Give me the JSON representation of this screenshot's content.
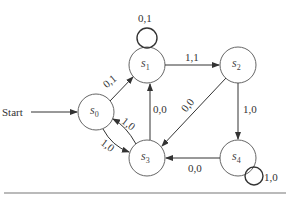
{
  "diagram": {
    "type": "finite-state machine",
    "start_label": "Start",
    "states": [
      {
        "id": "s0",
        "name": "s",
        "sub": "0",
        "x": 96,
        "y": 112
      },
      {
        "id": "s1",
        "name": "s",
        "sub": "1",
        "x": 147,
        "y": 65
      },
      {
        "id": "s2",
        "name": "s",
        "sub": "2",
        "x": 238,
        "y": 65
      },
      {
        "id": "s3",
        "name": "s",
        "sub": "3",
        "x": 147,
        "y": 158
      },
      {
        "id": "s4",
        "name": "s",
        "sub": "4",
        "x": 238,
        "y": 158
      }
    ],
    "transitions": [
      {
        "from": "s0",
        "to": "s1",
        "label": "0,1"
      },
      {
        "from": "s1",
        "to": "s1",
        "label": "0,1"
      },
      {
        "from": "s1",
        "to": "s2",
        "label": "1,1"
      },
      {
        "from": "s2",
        "to": "s3",
        "label": "0,0"
      },
      {
        "from": "s2",
        "to": "s4",
        "label": "1,0"
      },
      {
        "from": "s3",
        "to": "s1",
        "label": "0,0"
      },
      {
        "from": "s3",
        "to": "s0",
        "label": "1,0"
      },
      {
        "from": "s0",
        "to": "s3",
        "label": "1,0"
      },
      {
        "from": "s4",
        "to": "s3",
        "label": "0,0"
      },
      {
        "from": "s4",
        "to": "s4",
        "label": "1,0"
      }
    ]
  }
}
